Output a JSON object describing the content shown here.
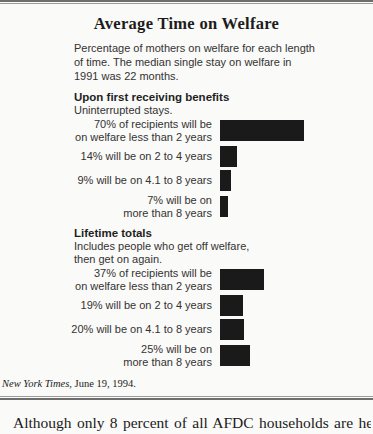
{
  "figure": {
    "title": "Average Time on Welfare",
    "subtitle_lines": [
      "Percentage of mothers on welfare for each length",
      "of time. The median single stay on welfare in",
      "1991 was 22 months."
    ],
    "source": {
      "publication": "New York Times,",
      "date": " June 19, 1994."
    }
  },
  "chart_data": {
    "type": "bar",
    "orientation": "horizontal",
    "title": "Average Time on Welfare",
    "subtitle": "Percentage of mothers on welfare for each length of time. The median single stay on welfare in 1991 was 22 months.",
    "unit": "percent",
    "value_range": [
      0,
      70
    ],
    "bar_color": "#1a1a1a",
    "grid": false,
    "legend": false,
    "groups": [
      {
        "heading": "Upon first receiving benefits",
        "subheading_lines": [
          "Uninterrupted stays."
        ],
        "bars": [
          {
            "value": 70,
            "label_lines": [
              "70% of recipients will be",
              "on welfare less than 2 years"
            ]
          },
          {
            "value": 14,
            "label_lines": [
              "14% will be on 2 to 4 years"
            ]
          },
          {
            "value": 9,
            "label_lines": [
              "9% will be on 4.1 to 8 years"
            ]
          },
          {
            "value": 7,
            "label_lines": [
              "7% will be on",
              "more than 8 years"
            ]
          }
        ]
      },
      {
        "heading": "Lifetime totals",
        "subheading_lines": [
          "Includes people who get off welfare,",
          "then get on again."
        ],
        "bars": [
          {
            "value": 37,
            "label_lines": [
              "37% of recipients will be",
              "on welfare less than 2 years"
            ]
          },
          {
            "value": 19,
            "label_lines": [
              "19% will be on 2 to 4 years"
            ]
          },
          {
            "value": 20,
            "label_lines": [
              "20% will be on 4.1 to 8 years"
            ]
          },
          {
            "value": 25,
            "label_lines": [
              "25% will be on",
              "more than 8 years"
            ]
          }
        ]
      }
    ],
    "source_citation": "New York Times, June 19, 1994."
  },
  "body_text": {
    "paragraph_fragment": "Although only 8 percent of all AFDC households are headed"
  },
  "colors": {
    "background": "#fafaf8",
    "bar": "#1a1a1a",
    "rule_dark": "#6e6e6e",
    "rule_light": "#9b9b9b"
  }
}
